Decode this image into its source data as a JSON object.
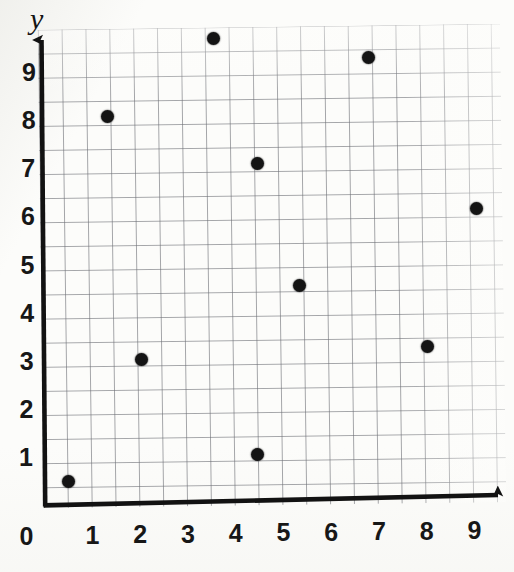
{
  "chart_data": {
    "type": "scatter",
    "title": "",
    "subtitle": "",
    "xlabel": "",
    "ylabel": "y",
    "xlim": [
      0,
      9.7
    ],
    "ylim": [
      0,
      9.9
    ],
    "grid": true,
    "grid_minor_step": 0.5,
    "legend": null,
    "legend_position": "none",
    "x_tick_labels": [
      "0",
      "1",
      "2",
      "3",
      "4",
      "5",
      "6",
      "7",
      "8",
      "9"
    ],
    "y_tick_labels": [
      "1",
      "2",
      "3",
      "4",
      "5",
      "6",
      "7",
      "8",
      "9"
    ],
    "origin_label": "0",
    "point_color": "#141414",
    "grid_color": "#6e7076",
    "axis_color": "#121212",
    "series": [
      {
        "name": "points",
        "points": [
          {
            "x": 0.5,
            "y": 0.5,
            "label": "(0.5, 0.5)"
          },
          {
            "x": 1.25,
            "y": 8.05,
            "label": "(1.25, 8)"
          },
          {
            "x": 2.0,
            "y": 3.0,
            "label": "(2, 3)"
          },
          {
            "x": 3.45,
            "y": 9.65,
            "label": "(3.45, 9.65)"
          },
          {
            "x": 4.4,
            "y": 7.05,
            "label": "(4.4, 7)"
          },
          {
            "x": 4.45,
            "y": 1.0,
            "label": "(4.45, 1)"
          },
          {
            "x": 5.3,
            "y": 4.5,
            "label": "(5.3, 4.5)"
          },
          {
            "x": 6.7,
            "y": 9.2,
            "label": "(6.7, 9.2)"
          },
          {
            "x": 8.0,
            "y": 3.2,
            "label": "(8, 3.2)"
          },
          {
            "x": 9.0,
            "y": 6.05,
            "label": "(9, 6.05)"
          }
        ]
      }
    ]
  }
}
